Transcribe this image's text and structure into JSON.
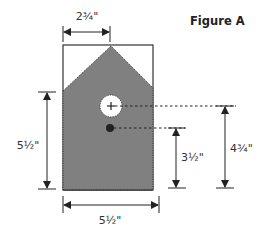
{
  "figure": {
    "title": "Figure A",
    "colors": {
      "fill": "#808080",
      "outline": "#333333",
      "background": "#ffffff",
      "ink": "#222222"
    }
  },
  "dimensions": {
    "top_width": "2¾\"",
    "left_height": "5½\"",
    "bottom_width": "5½\"",
    "dot_height": "3½\"",
    "hole_height": "4¾\""
  }
}
